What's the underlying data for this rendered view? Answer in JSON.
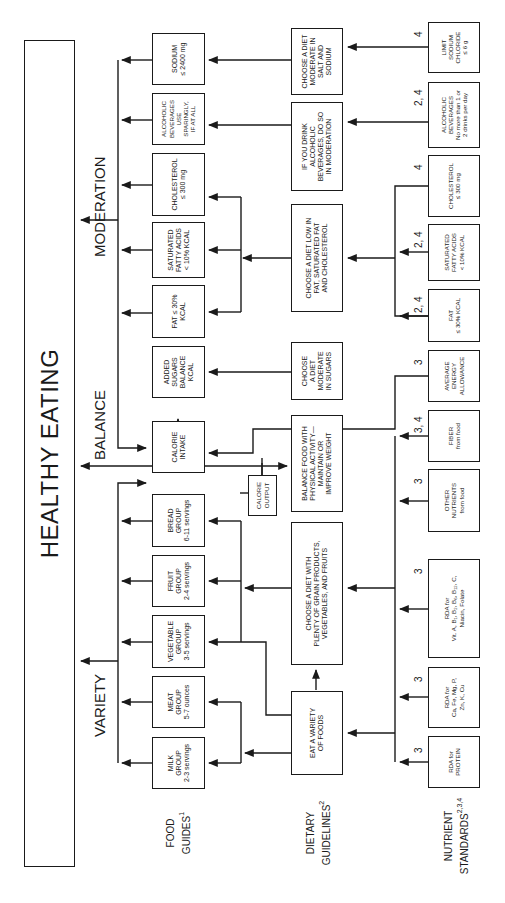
{
  "title": "HEALTHY EATING",
  "sections": {
    "moderation": "MODERATION",
    "balance": "BALANCE",
    "variety": "VARIETY"
  },
  "row_labels": {
    "food_guides": {
      "text": "FOOD\nGUIDES",
      "sup": "1"
    },
    "dietary_guidelines": {
      "text": "DIETARY\nGUIDELINES",
      "sup": "2"
    },
    "nutrient_standards": {
      "text": "NUTRIENT\nSTANDARDS",
      "sup": "2,3,4"
    }
  },
  "food_guides": [
    {
      "id": "milk",
      "text": "MILK\nGROUP\n2-3 servings"
    },
    {
      "id": "meat",
      "text": "MEAT\nGROUP\n5-7 ounces"
    },
    {
      "id": "vegetable",
      "text": "VEGETABLE\nGROUP\n3-5 servings"
    },
    {
      "id": "fruit",
      "text": "FRUIT\nGROUP\n2-4 servings"
    },
    {
      "id": "bread",
      "text": "BREAD\nGROUP\n6-11 servings"
    },
    {
      "id": "calorie-intake",
      "text": "CALORIE\nINTAKE"
    },
    {
      "id": "added-sugars",
      "text": "ADDED\nSUGARS\nBALANCE\nKCAL"
    },
    {
      "id": "fat",
      "text": "FAT ≤ 30%\nKCAL"
    },
    {
      "id": "saturated-fat",
      "text": "SATURATED\nFATTY ACIDS\n< 10% KCAL"
    },
    {
      "id": "cholesterol",
      "text": "CHOLESTEROL\n≤ 300 mg"
    },
    {
      "id": "alcohol",
      "text": "ALCOHOLIC\nBEVERAGES\nUSE\nSPARINGLY,\nIF AT ALL"
    },
    {
      "id": "sodium",
      "text": "SODIUM\n≤ 2400 mg"
    }
  ],
  "calorie_output": "CALORIE\nOUTPUT",
  "dietary_guidelines": [
    {
      "id": "variety",
      "text": "EAT A VARIETY\nOF FOODS"
    },
    {
      "id": "plenty",
      "text": "CHOOSE A DIET WITH\nPLENTY OF GRAIN PRODUCTS,\nVEGETABLES, AND FRUITS"
    },
    {
      "id": "balance",
      "text": "BALANCE FOOD WITH\nPHYSICAL ACTIVITY—\nMAINTAIN OR\nIMPROVE WEIGHT"
    },
    {
      "id": "sugars",
      "text": "CHOOSE\nA DIET\nMODERATE\nIN SUGARS"
    },
    {
      "id": "low-fat",
      "text": "CHOOSE A DIET LOW IN\nFAT, SATURATED FAT\nAND CHOLESTEROL"
    },
    {
      "id": "alcohol",
      "text": "IF YOU DRINK\nALCOHOLIC\nBEVERAGES, DO SO\nIN MODERATION"
    },
    {
      "id": "salt",
      "text": "CHOOSE A DIET\nMODERATE IN\nSALT AND\nSODIUM"
    }
  ],
  "nutrient_standards": [
    {
      "id": "rda-protein",
      "text": "RDA for\nPROTEIN",
      "ref": "3"
    },
    {
      "id": "rda-minerals",
      "text": "RDA for\nCa, Fe, Mg, P,\nZn, K, Cu",
      "ref": "3"
    },
    {
      "id": "rda-vitamins",
      "text": "RDA for\nVit. A, B₁, B₂, B₆, B₁₂, C,\nNiacin, Folate",
      "ref": "3"
    },
    {
      "id": "other-nutrients",
      "text": "OTHER\nNUTRIENTS\nfrom food",
      "ref": "3"
    },
    {
      "id": "fiber",
      "text": "FIBER\nfrom food",
      "ref": "3, 4"
    },
    {
      "id": "average-energy",
      "text": "AVERAGE\nENERGY\nALLOWANCE",
      "ref": "3"
    },
    {
      "id": "fat",
      "text": "FAT\n≤ 30% KCAL",
      "ref": "2, 4"
    },
    {
      "id": "saturated-fat",
      "text": "SATURATED\nFATTY ACIDS\n< 10% KCAL",
      "ref": "2, 4"
    },
    {
      "id": "cholesterol",
      "text": "CHOLESTEROL\n≤ 300 mg",
      "ref": "4"
    },
    {
      "id": "alcohol",
      "text": "ALCOHOLIC\nBEVERAGES\nNo more than 1 or\n2 drinks per day",
      "ref": "2, 4"
    },
    {
      "id": "sodium-chloride",
      "text": "LIMIT\nSODIUM\nCHLORIDE\n≤ 6 g",
      "ref": "4"
    }
  ],
  "colors": {
    "ink": "#1a1a1a",
    "background": "#ffffff"
  }
}
